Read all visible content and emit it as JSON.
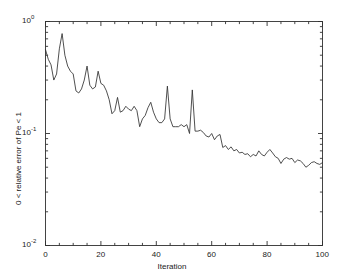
{
  "chart_data": {
    "type": "line",
    "title": "",
    "xlabel": "Iteration",
    "ylabel": "0 < relative error of  Pe < 1",
    "xlim": [
      0,
      100
    ],
    "ylim": [
      0.01,
      1
    ],
    "yscale": "log",
    "xscale": "linear",
    "grid": false,
    "legend": null,
    "line_color": "#303030",
    "background_color": "#ffffff",
    "axis_color": "#303030",
    "xticks": [
      0,
      20,
      40,
      60,
      80,
      100
    ],
    "xtick_labels": [
      "0",
      "20",
      "40",
      "60",
      "80",
      "100"
    ],
    "yticks": [
      0.01,
      0.1,
      1
    ],
    "ytick_labels": [
      "10⁻²",
      "10⁻¹",
      "10⁰"
    ],
    "ytick_mantissa": [
      "10",
      "10",
      "10"
    ],
    "ytick_exponents": [
      "-2",
      "-1",
      "0"
    ],
    "series": [
      {
        "name": "relative error of Pe",
        "x": [
          0,
          1,
          2,
          3,
          4,
          5,
          6,
          7,
          8,
          9,
          10,
          11,
          12,
          13,
          14,
          15,
          16,
          17,
          18,
          19,
          20,
          21,
          22,
          23,
          24,
          25,
          26,
          27,
          28,
          29,
          30,
          31,
          32,
          33,
          34,
          35,
          36,
          37,
          38,
          39,
          40,
          41,
          42,
          43,
          44,
          45,
          46,
          47,
          48,
          49,
          50,
          51,
          52,
          53,
          54,
          55,
          56,
          57,
          58,
          59,
          60,
          61,
          62,
          63,
          64,
          65,
          66,
          67,
          68,
          69,
          70,
          71,
          72,
          73,
          74,
          75,
          76,
          77,
          78,
          79,
          80,
          81,
          82,
          83,
          84,
          85,
          86,
          87,
          88,
          89,
          90,
          91,
          92,
          93,
          94,
          95,
          96,
          97,
          98,
          99,
          100
        ],
        "values": [
          0.56,
          0.46,
          0.41,
          0.3,
          0.34,
          0.57,
          0.78,
          0.5,
          0.4,
          0.36,
          0.34,
          0.24,
          0.23,
          0.25,
          0.3,
          0.4,
          0.27,
          0.25,
          0.26,
          0.36,
          0.28,
          0.27,
          0.24,
          0.2,
          0.15,
          0.16,
          0.21,
          0.155,
          0.16,
          0.175,
          0.165,
          0.16,
          0.175,
          0.16,
          0.115,
          0.135,
          0.145,
          0.17,
          0.19,
          0.155,
          0.135,
          0.125,
          0.125,
          0.135,
          0.265,
          0.135,
          0.115,
          0.115,
          0.115,
          0.12,
          0.115,
          0.12,
          0.1,
          0.245,
          0.105,
          0.105,
          0.107,
          0.102,
          0.095,
          0.093,
          0.1,
          0.088,
          0.095,
          0.098,
          0.075,
          0.078,
          0.072,
          0.076,
          0.07,
          0.072,
          0.067,
          0.068,
          0.065,
          0.066,
          0.062,
          0.065,
          0.063,
          0.07,
          0.065,
          0.063,
          0.068,
          0.072,
          0.067,
          0.062,
          0.06,
          0.054,
          0.059,
          0.061,
          0.059,
          0.06,
          0.055,
          0.058,
          0.057,
          0.054,
          0.05,
          0.052,
          0.055,
          0.056,
          0.054,
          0.053,
          0.055
        ]
      }
    ]
  },
  "axes": {
    "x_title": "Iteration",
    "y_title": "0 < relative error of  Pe < 1"
  }
}
